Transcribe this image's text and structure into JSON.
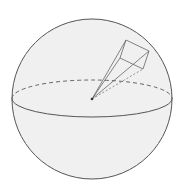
{
  "diagram": {
    "title": "Sphere with pyramid from center",
    "colors": {
      "background": "#ffffff",
      "sphere_fill": "#f0f0f0",
      "stroke": "#555555",
      "hidden_stroke": "#666666"
    },
    "sphere": {
      "cx": 92,
      "cy": 99,
      "r": 80
    },
    "equator": {
      "cx": 92,
      "cy": 98.5,
      "rx": 80,
      "ry": 18.5
    },
    "apex": {
      "x": 92,
      "y": 99
    },
    "pyramid_base": [
      {
        "name": "A",
        "x": 126,
        "y": 40
      },
      {
        "name": "B",
        "x": 149,
        "y": 51
      },
      {
        "name": "C",
        "x": 143,
        "y": 69
      },
      {
        "name": "D",
        "x": 120,
        "y": 58
      }
    ]
  }
}
